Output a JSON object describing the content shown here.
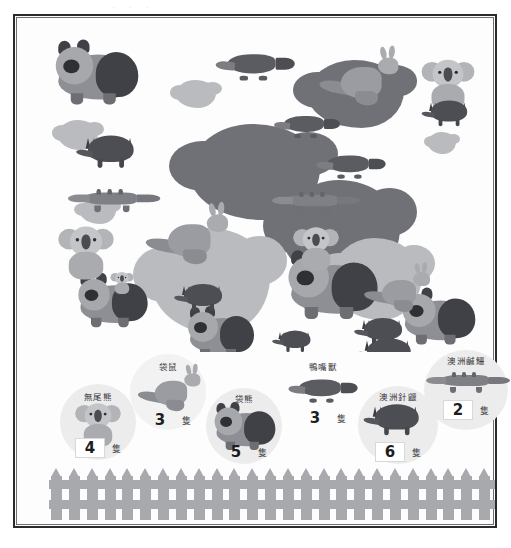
{
  "page": {
    "top_remnant": "···"
  },
  "scene": {
    "name": "australian-animals-scene",
    "description": "Overlapping illustrated Australian animals with grey paint splats"
  },
  "legend": {
    "unit": "隻",
    "items": [
      {
        "key": "koala",
        "label": "無尾熊",
        "count": "4",
        "unit": "隻",
        "icon": "koala-icon",
        "disc_color": "#ececec"
      },
      {
        "key": "kangaroo",
        "label": "袋鼠",
        "count": "3",
        "unit": "隻",
        "icon": "kangaroo-icon",
        "disc_color": "#f0f0f0"
      },
      {
        "key": "wombat",
        "label": "袋熊",
        "count": "5",
        "unit": "隻",
        "icon": "wombat-icon",
        "disc_color": "#ececec"
      },
      {
        "key": "platypus",
        "label": "鴨嘴獸",
        "count": "3",
        "unit": "隻",
        "icon": "platypus-icon",
        "disc_color": "#ffffff"
      },
      {
        "key": "echidna",
        "label": "澳洲針鼴",
        "count": "6",
        "unit": "隻",
        "icon": "echidna-icon",
        "disc_color": "#ececec"
      },
      {
        "key": "crocodile",
        "label": "澳洲鹹鱷",
        "count": "2",
        "unit": "隻",
        "icon": "crocodile-icon",
        "disc_color": "#ececec"
      }
    ]
  },
  "fence": {
    "name": "picket-fence",
    "pickets": 25,
    "color": "#a7a9ad"
  },
  "colors": {
    "frame": "#2b2b2e",
    "background": "#ffffff",
    "animal_dark": "#4c4e53",
    "animal_mid": "#8d8f94",
    "animal_light": "#c3c5c9",
    "splat": "#6f7176",
    "splat_light": "#b9bbbf"
  }
}
